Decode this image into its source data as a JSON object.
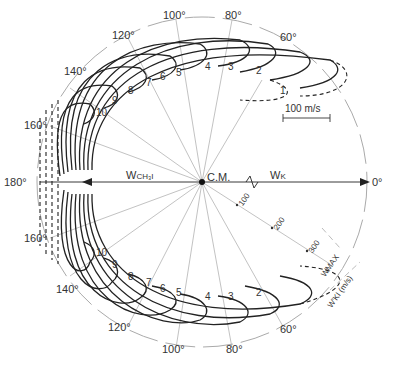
{
  "diagram": {
    "center_label": "C.M.",
    "w_ch3i_label": "W",
    "w_ch3i_sub": "CH₃I",
    "w_k_label": "W",
    "w_k_sub": "K",
    "scale_bar_label": "100 m/s",
    "wmax_label": "W",
    "wmax_sub": "MAX",
    "wki_label": "W'",
    "wki_sub": "KI",
    "wki_unit": "(m/s)",
    "speed_ticks": [
      "100",
      "200",
      "300"
    ],
    "angle_labels": {
      "a0": "0°",
      "a60_top": "60°",
      "a80_top": "80°",
      "a100_top": "100°",
      "a120_top": "120°",
      "a140_top": "140°",
      "a160_top": "160°",
      "a180": "180°",
      "a160_bot": "160°",
      "a140_bot": "140°",
      "a120_bot": "120°",
      "a100_bot": "100°",
      "a80_bot": "80°",
      "a60_bot": "60°"
    },
    "contour_labels_top": [
      "1",
      "2",
      "3",
      "4",
      "5",
      "6",
      "7",
      "8",
      "9",
      "10"
    ],
    "contour_labels_bottom": [
      "2",
      "3",
      "4",
      "5",
      "6",
      "7",
      "8",
      "9",
      "10"
    ]
  }
}
